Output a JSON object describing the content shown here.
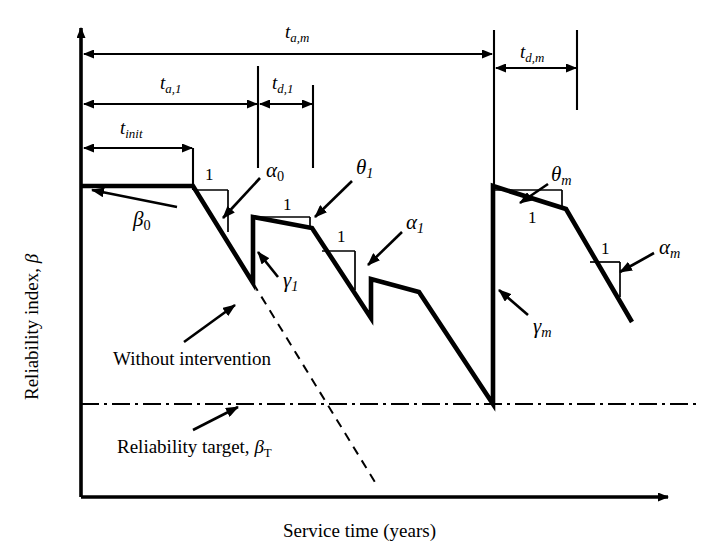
{
  "figure": {
    "kind": "reliability-profile-diagram",
    "background": "#ffffff",
    "ink": "#000000",
    "width": 718,
    "height": 556
  },
  "axes": {
    "y_label_text": "Reliability index, ",
    "y_label_symbol": "β",
    "x_label": "Service time (years)",
    "x_axis_y": 497,
    "y_axis_x": 81,
    "x_axis_end": 668,
    "y_axis_top": 28
  },
  "dimensions": [
    {
      "name": "t_a_m",
      "base": "t",
      "sub": "a,m",
      "label_x": 285,
      "label_y": 22,
      "line_y": 54,
      "from_x": 84,
      "to_x": 492
    },
    {
      "name": "t_d_m",
      "base": "t",
      "sub": "d,m",
      "label_x": 520,
      "label_y": 42,
      "line_y": 68,
      "from_x": 496,
      "to_x": 576
    },
    {
      "name": "t_a_1",
      "base": "t",
      "sub": "a,1",
      "label_x": 160,
      "label_y": 73,
      "line_y": 104,
      "from_x": 84,
      "to_x": 257
    },
    {
      "name": "t_d_1",
      "base": "t",
      "sub": "d,1",
      "label_x": 272,
      "label_y": 73,
      "line_y": 104,
      "from_x": 260,
      "to_x": 312
    },
    {
      "name": "t_init",
      "base": "t",
      "sub": "init",
      "label_x": 120,
      "label_y": 118,
      "line_y": 148,
      "from_x": 84,
      "to_x": 192
    }
  ],
  "vertical_guides": [
    {
      "name": "guide-t-init",
      "x": 193,
      "y1": 148,
      "y2": 190
    },
    {
      "name": "guide-t-a-1",
      "x": 258,
      "y1": 66,
      "y2": 168
    },
    {
      "name": "guide-t-d-1",
      "x": 313,
      "y1": 85,
      "y2": 168
    },
    {
      "name": "guide-t-a-m",
      "x": 494,
      "y1": 30,
      "y2": 188
    },
    {
      "name": "guide-t-d-m",
      "x": 577,
      "y1": 30,
      "y2": 110
    }
  ],
  "curves": {
    "main_profile": "81,186 193,186 253,283 253,217 312,228 371,318 371,279 419,292 493,404 493,186 566,209 632,322",
    "without_intervention": "253,283 378,487",
    "reliability_target_y": 404,
    "target_from_x": 81,
    "target_to_x": 700
  },
  "slope_triangles": [
    {
      "name": "slope-alpha-0",
      "label": "1",
      "label_x": 205,
      "label_y": 166,
      "top_y": 190,
      "x1": 193,
      "x2": 228,
      "bottom_y": 232
    },
    {
      "name": "slope-theta-1",
      "label": "1",
      "label_x": 283,
      "label_y": 196,
      "top_y": 217,
      "x1": 253,
      "x2": 310,
      "bottom_y": 228
    },
    {
      "name": "slope-alpha-1",
      "label": "1",
      "label_x": 337,
      "label_y": 228,
      "top_y": 251,
      "x1": 322,
      "x2": 355,
      "bottom_y": 290
    },
    {
      "name": "slope-theta-m",
      "label": "1",
      "label_x": 528,
      "label_y": 209,
      "top_y": 190,
      "x1": 493,
      "x2": 562,
      "bottom_y": 206
    },
    {
      "name": "slope-alpha-m",
      "label": "1",
      "label_x": 601,
      "label_y": 240,
      "top_y": 262,
      "x1": 590,
      "x2": 620,
      "bottom_y": 297
    }
  ],
  "annotations": [
    {
      "name": "beta-0",
      "base": "β",
      "sub": "0",
      "sub_style": "upright",
      "label_x": 133,
      "label_y": 209,
      "arrow": "177,207 92,190"
    },
    {
      "name": "alpha-0",
      "base": "α",
      "sub": "0",
      "sub_style": "upright",
      "label_x": 266,
      "label_y": 160,
      "arrow": "260,178 223,218"
    },
    {
      "name": "theta-1",
      "base": "θ",
      "sub": "1",
      "sub_style": "italic",
      "label_x": 356,
      "label_y": 157,
      "arrow": "352,181 315,217"
    },
    {
      "name": "alpha-1",
      "base": "α",
      "sub": "1",
      "sub_style": "italic",
      "label_x": 406,
      "label_y": 212,
      "arrow": "402,232 368,265"
    },
    {
      "name": "gamma-1",
      "base": "γ",
      "sub": "1",
      "sub_style": "italic",
      "label_x": 283,
      "label_y": 270,
      "arrow": "278,277 258,252"
    },
    {
      "name": "gamma-m",
      "base": "γ",
      "sub": "m",
      "sub_style": "italic",
      "label_x": 533,
      "label_y": 316,
      "arrow": "528,315 499,290"
    },
    {
      "name": "theta-m",
      "base": "θ",
      "sub": "m",
      "sub_style": "italic",
      "label_x": 551,
      "label_y": 164,
      "arrow": "548,184 520,203"
    },
    {
      "name": "alpha-m",
      "base": "α",
      "sub": "m",
      "sub_style": "italic",
      "label_x": 659,
      "label_y": 237,
      "arrow": "654,253 620,272"
    }
  ],
  "text_callouts": [
    {
      "name": "without-intervention",
      "text": "Without intervention",
      "label_x": 113,
      "label_y": 349,
      "arrow": "184,342 235,305"
    },
    {
      "name": "reliability-target",
      "text_prefix": "Reliability target, ",
      "symbol": "β",
      "symbol_sub": "T",
      "label_x": 117,
      "label_y": 437,
      "arrow": "193,430 238,407"
    }
  ]
}
